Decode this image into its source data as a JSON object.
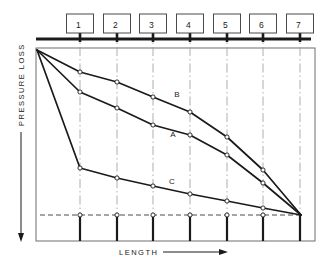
{
  "figure": {
    "background_color": "#ffffff",
    "line_color": "#1a1a1a",
    "grid_color": "#9a9a9a"
  },
  "axes": {
    "y_label": "PRESSURE LOSS",
    "x_label": "LENGTH",
    "y_arrow_direction": "down",
    "x_arrow_direction": "right",
    "frame": {
      "left": 36,
      "top": 48,
      "right": 315,
      "bottom": 241
    }
  },
  "pipe": {
    "name": "header-pipe",
    "y": 39,
    "x_start": 36,
    "x_end": 311,
    "nodes": [
      {
        "label": "1",
        "x": 80
      },
      {
        "label": "2",
        "x": 117
      },
      {
        "label": "3",
        "x": 153
      },
      {
        "label": "4",
        "x": 190
      },
      {
        "label": "5",
        "x": 227
      },
      {
        "label": "6",
        "x": 263
      },
      {
        "label": "7",
        "x": 300
      }
    ]
  },
  "gridlines": {
    "style": "dash-dot",
    "x_positions": [
      80,
      117,
      153,
      190,
      227,
      263,
      300
    ]
  },
  "baseline": {
    "name": "reference-baseline",
    "style": "dashed",
    "y": 215,
    "x_start": 40,
    "x_end": 301,
    "marker_x_positions": [
      80,
      117,
      153,
      190,
      227,
      263
    ]
  },
  "risers": {
    "top_y": 215,
    "bottom_y": 241,
    "x_positions": [
      80,
      117,
      153,
      190,
      227,
      263,
      300
    ]
  },
  "chart_data": {
    "type": "line",
    "xlabel": "LENGTH",
    "ylabel": "PRESSURE LOSS",
    "grid": true,
    "legend": "inline-labels",
    "note": "Y axis increases downward from origin at top-left; all curves start at the common inlet point and converge at the far end node 7.",
    "x_categories": [
      "0",
      "1",
      "2",
      "3",
      "4",
      "5",
      "6",
      "7"
    ],
    "series": [
      {
        "name": "B",
        "label": "B",
        "label_x": 177,
        "label_y": 97,
        "points": [
          {
            "x": 37,
            "y": 50
          },
          {
            "x": 80,
            "y": 72
          },
          {
            "x": 117,
            "y": 82
          },
          {
            "x": 153,
            "y": 97
          },
          {
            "x": 190,
            "y": 112
          },
          {
            "x": 227,
            "y": 137
          },
          {
            "x": 263,
            "y": 170
          },
          {
            "x": 301,
            "y": 215
          }
        ]
      },
      {
        "name": "A",
        "label": "A",
        "label_x": 173,
        "label_y": 137,
        "points": [
          {
            "x": 37,
            "y": 50
          },
          {
            "x": 80,
            "y": 92
          },
          {
            "x": 117,
            "y": 108
          },
          {
            "x": 153,
            "y": 125
          },
          {
            "x": 190,
            "y": 135
          },
          {
            "x": 227,
            "y": 155
          },
          {
            "x": 263,
            "y": 183
          },
          {
            "x": 301,
            "y": 215
          }
        ]
      },
      {
        "name": "C",
        "label": "C",
        "label_x": 172,
        "label_y": 184,
        "points": [
          {
            "x": 37,
            "y": 50
          },
          {
            "x": 80,
            "y": 168
          },
          {
            "x": 117,
            "y": 178
          },
          {
            "x": 153,
            "y": 186
          },
          {
            "x": 190,
            "y": 194
          },
          {
            "x": 227,
            "y": 201
          },
          {
            "x": 263,
            "y": 208
          },
          {
            "x": 301,
            "y": 215
          }
        ]
      }
    ]
  }
}
